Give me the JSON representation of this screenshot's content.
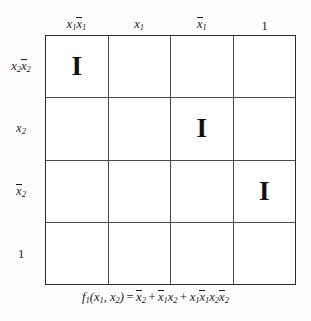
{
  "figure": {
    "type": "karnaugh-style-map",
    "columns": [
      {
        "label": "x1x̄1",
        "plain": "x1 x1bar"
      },
      {
        "label": "x1",
        "plain": "x1"
      },
      {
        "label": "x̄1",
        "plain": "x1bar"
      },
      {
        "label": "1",
        "plain": "1"
      }
    ],
    "rows": [
      {
        "label": "x2x̄2",
        "plain": "x2 x2bar"
      },
      {
        "label": "x2",
        "plain": "x2"
      },
      {
        "label": "x̄2",
        "plain": "x2bar"
      },
      {
        "label": "1",
        "plain": "1"
      }
    ],
    "cells": [
      [
        "I",
        "",
        "",
        ""
      ],
      [
        "",
        "",
        "I",
        ""
      ],
      [
        "",
        "",
        "",
        "I"
      ],
      [
        "",
        "",
        "",
        ""
      ]
    ],
    "mark_symbol": "I",
    "caption": {
      "function_name": "f",
      "function_sub": "1",
      "args": "(x₁, x₂)",
      "equals": "=",
      "terms": [
        "x̄2",
        "x̄1x2",
        "x1x̄1x2x̄2"
      ],
      "plus": "+",
      "full_text": "f₁(x₁, x₂) = x̄2 + x̄1x₂ + x₁x̄1x₂x̄2"
    },
    "colors": {
      "background": "#fdfdfc",
      "grid_outer_border": "#2b2b2b",
      "grid_inner_line": "#4a4a4a",
      "text": "#1a1a1a",
      "mark": "#111111"
    }
  }
}
